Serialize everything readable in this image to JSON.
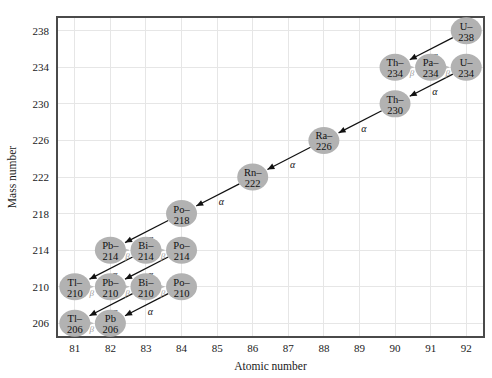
{
  "chart_data": {
    "type": "scatter",
    "title": "",
    "xlabel": "Atomic number",
    "ylabel": "Mass number",
    "xlim": [
      80.5,
      92.5
    ],
    "ylim": [
      204.5,
      239.5
    ],
    "xticks": [
      81,
      82,
      83,
      84,
      85,
      86,
      87,
      88,
      89,
      90,
      91,
      92
    ],
    "yticks": [
      206,
      210,
      214,
      218,
      222,
      226,
      230,
      234,
      238
    ],
    "grid": true,
    "legend": "none",
    "nodes": [
      {
        "id": "U238",
        "label_line1": "U–",
        "label_line2": "238",
        "x": 92,
        "y": 238
      },
      {
        "id": "Th234",
        "label_line1": "Th–",
        "label_line2": "234",
        "x": 90,
        "y": 234
      },
      {
        "id": "Pa234",
        "label_line1": "Pa–",
        "label_line2": "234",
        "x": 91,
        "y": 234
      },
      {
        "id": "U234",
        "label_line1": "U–",
        "label_line2": "234",
        "x": 92,
        "y": 234
      },
      {
        "id": "Th230",
        "label_line1": "Th–",
        "label_line2": "230",
        "x": 90,
        "y": 230
      },
      {
        "id": "Ra226",
        "label_line1": "Ra–",
        "label_line2": "226",
        "x": 88,
        "y": 226
      },
      {
        "id": "Rn222",
        "label_line1": "Rn–",
        "label_line2": "222",
        "x": 86,
        "y": 222
      },
      {
        "id": "Po218",
        "label_line1": "Po–",
        "label_line2": "218",
        "x": 84,
        "y": 218
      },
      {
        "id": "Pb214",
        "label_line1": "Pb–",
        "label_line2": "214",
        "x": 82,
        "y": 214
      },
      {
        "id": "Bi214",
        "label_line1": "Bi–",
        "label_line2": "214",
        "x": 83,
        "y": 214
      },
      {
        "id": "Po214",
        "label_line1": "Po–",
        "label_line2": "214",
        "x": 84,
        "y": 214
      },
      {
        "id": "Tl210",
        "label_line1": "Tl–",
        "label_line2": "210",
        "x": 81,
        "y": 210
      },
      {
        "id": "Pb210",
        "label_line1": "Pb–",
        "label_line2": "210",
        "x": 82,
        "y": 210
      },
      {
        "id": "Bi210",
        "label_line1": "Bi–",
        "label_line2": "210",
        "x": 83,
        "y": 210
      },
      {
        "id": "Po210",
        "label_line1": "Po–",
        "label_line2": "210",
        "x": 84,
        "y": 210
      },
      {
        "id": "Tl206",
        "label_line1": "Tl–",
        "label_line2": "206",
        "x": 81,
        "y": 206
      },
      {
        "id": "Pb206",
        "label_line1": "Pb",
        "label_line2": "206",
        "x": 82,
        "y": 206
      }
    ],
    "decays": [
      {
        "from": "U238",
        "to": "Th234",
        "type": "alpha",
        "label": "α"
      },
      {
        "from": "Th234",
        "to": "Pa234",
        "type": "beta",
        "label": "β"
      },
      {
        "from": "Pa234",
        "to": "U234",
        "type": "beta",
        "label": "β"
      },
      {
        "from": "U234",
        "to": "Th230",
        "type": "alpha",
        "label": "α"
      },
      {
        "from": "Th230",
        "to": "Ra226",
        "type": "alpha",
        "label": "α"
      },
      {
        "from": "Ra226",
        "to": "Rn222",
        "type": "alpha",
        "label": "α"
      },
      {
        "from": "Rn222",
        "to": "Po218",
        "type": "alpha",
        "label": "α"
      },
      {
        "from": "Po218",
        "to": "Pb214",
        "type": "alpha",
        "label": "α"
      },
      {
        "from": "Pb214",
        "to": "Bi214",
        "type": "beta",
        "label": "β"
      },
      {
        "from": "Bi214",
        "to": "Po214",
        "type": "beta",
        "label": "β"
      },
      {
        "from": "Bi214",
        "to": "Tl210",
        "type": "alpha",
        "label": "α"
      },
      {
        "from": "Po214",
        "to": "Pb210",
        "type": "alpha",
        "label": "α"
      },
      {
        "from": "Tl210",
        "to": "Pb210",
        "type": "beta",
        "label": "β"
      },
      {
        "from": "Pb210",
        "to": "Bi210",
        "type": "beta",
        "label": "β"
      },
      {
        "from": "Bi210",
        "to": "Po210",
        "type": "beta",
        "label": "β"
      },
      {
        "from": "Bi210",
        "to": "Tl206",
        "type": "alpha",
        "label": "α"
      },
      {
        "from": "Po210",
        "to": "Pb206",
        "type": "alpha",
        "label": "α"
      },
      {
        "from": "Tl206",
        "to": "Pb206",
        "type": "beta",
        "label": "β"
      }
    ],
    "colors": {
      "node_fill": "#b2b2b2",
      "alpha_arrow": "#111111",
      "beta_arrow": "#bdbdbd",
      "gridline": "#e6e6e6",
      "frame": "#4a4a4a",
      "background": "#ffffff"
    }
  }
}
